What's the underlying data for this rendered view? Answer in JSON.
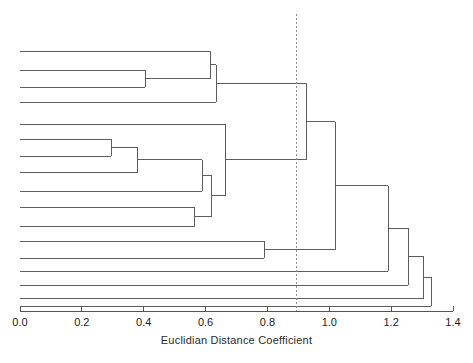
{
  "chart_data": {
    "type": "dendrogram",
    "title": "",
    "xlabel": "Euclidian Distance Coefficient",
    "ylabel": "",
    "xlim": [
      0.0,
      1.4
    ],
    "xticks": [
      0.0,
      0.2,
      0.4,
      0.6,
      0.8,
      1.0,
      1.2,
      1.4
    ],
    "xtick_labels": [
      "0.0",
      "0.2",
      "0.4",
      "0.6",
      "0.8",
      "1.0",
      "1.2",
      "1.4"
    ],
    "grid": false,
    "legend": null,
    "line_color": "#4d4d4d",
    "axis_color": "#555555",
    "cut_line": {
      "value": 0.895,
      "style": "dashed",
      "color": "#8c8c8c",
      "orientation": "vertical"
    },
    "n_leaves": 17,
    "leaves": [
      {
        "id": 1,
        "y": 51
      },
      {
        "id": 2,
        "y": 70
      },
      {
        "id": 3,
        "y": 87
      },
      {
        "id": 4,
        "y": 102
      },
      {
        "id": 5,
        "y": 124
      },
      {
        "id": 6,
        "y": 139
      },
      {
        "id": 7,
        "y": 156
      },
      {
        "id": 8,
        "y": 172
      },
      {
        "id": 9,
        "y": 191
      },
      {
        "id": 10,
        "y": 207
      },
      {
        "id": 11,
        "y": 226
      },
      {
        "id": 12,
        "y": 241
      },
      {
        "id": 13,
        "y": 258
      },
      {
        "id": 14,
        "y": 271
      },
      {
        "id": 15,
        "y": 285
      },
      {
        "id": 16,
        "y": 298
      },
      {
        "id": 17,
        "y": 306
      }
    ],
    "merges": [
      {
        "id": "m1",
        "height": 0.405,
        "children": [
          "leaf2",
          "leaf3"
        ]
      },
      {
        "id": "m2",
        "height": 0.615,
        "children": [
          "leaf1",
          "m1"
        ]
      },
      {
        "id": "m3",
        "height": 0.635,
        "children": [
          "m2",
          "leaf4"
        ]
      },
      {
        "id": "m4",
        "height": 0.295,
        "children": [
          "leaf6",
          "leaf7"
        ]
      },
      {
        "id": "m5",
        "height": 0.38,
        "children": [
          "m4",
          "leaf8"
        ]
      },
      {
        "id": "m6",
        "height": 0.59,
        "children": [
          "m5",
          "leaf9"
        ]
      },
      {
        "id": "m7",
        "height": 0.565,
        "children": [
          "leaf10",
          "leaf11"
        ]
      },
      {
        "id": "m8",
        "height": 0.62,
        "children": [
          "m6",
          "m7"
        ]
      },
      {
        "id": "m9",
        "height": 0.665,
        "children": [
          "leaf5",
          "m8"
        ]
      },
      {
        "id": "m10",
        "height": 0.925,
        "children": [
          "m3",
          "m9"
        ]
      },
      {
        "id": "m11",
        "height": 0.79,
        "children": [
          "leaf12",
          "leaf13"
        ]
      },
      {
        "id": "m12",
        "height": 1.02,
        "children": [
          "m10",
          "m11"
        ]
      },
      {
        "id": "m13",
        "height": 1.19,
        "children": [
          "m12",
          "leaf14"
        ]
      },
      {
        "id": "m14",
        "height": 1.255,
        "children": [
          "m13",
          "leaf15"
        ]
      },
      {
        "id": "m15",
        "height": 1.305,
        "children": [
          "m14",
          "leaf16"
        ]
      },
      {
        "id": "m16",
        "height": 1.33,
        "children": [
          "m15",
          "leaf17"
        ]
      }
    ]
  },
  "axis": {
    "title": "Euclidian Distance Coefficient",
    "ticks": [
      {
        "label": "0.0",
        "value": 0.0
      },
      {
        "label": "0.2",
        "value": 0.2
      },
      {
        "label": "0.4",
        "value": 0.4
      },
      {
        "label": "0.6",
        "value": 0.6
      },
      {
        "label": "0.8",
        "value": 0.8
      },
      {
        "label": "1.0",
        "value": 1.0
      },
      {
        "label": "1.2",
        "value": 1.2
      },
      {
        "label": "1.4",
        "value": 1.4
      }
    ]
  }
}
